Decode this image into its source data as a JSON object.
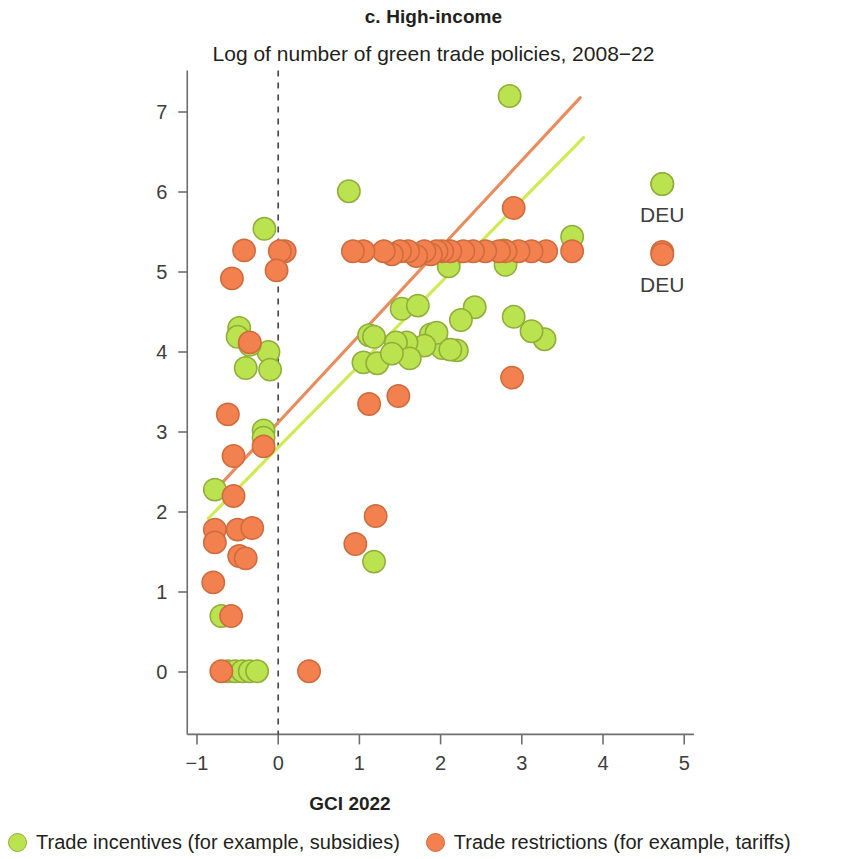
{
  "header": {
    "panel_label": "c. High-income",
    "subtitle": "Log of number of green trade policies, 2008−22"
  },
  "axes": {
    "x_title": "GCI 2022",
    "x_ticks": [
      "−1",
      "0",
      "1",
      "2",
      "3",
      "4",
      "5"
    ],
    "x_tick_values": [
      -1,
      0,
      1,
      2,
      3,
      4,
      5
    ],
    "y_ticks": [
      "0",
      "1",
      "2",
      "3",
      "4",
      "5",
      "6",
      "7"
    ],
    "y_tick_values": [
      0,
      1,
      2,
      3,
      4,
      5,
      6,
      7
    ]
  },
  "legend": {
    "items": [
      {
        "label": "Trade incentives (for example, subsidies)",
        "color": "#BBE34F",
        "swatch": "circle-green"
      },
      {
        "label": "Trade restrictions (for example, tariffs)",
        "color": "#F3804F",
        "swatch": "circle-orange"
      }
    ]
  },
  "annotations": [
    {
      "text": "DEU",
      "x": 4.73,
      "y": 5.73,
      "series": "Trade incentives (for example, subsidies)"
    },
    {
      "text": "DEU",
      "x": 4.73,
      "y": 4.85,
      "series": "Trade restrictions (for example, tariffs)"
    }
  ],
  "colors": {
    "incentives": "#BBE34F",
    "incentives_stroke": "#8FAE3A",
    "restrictions": "#F3804F",
    "restrictions_stroke": "#CF6B3C",
    "fit_incentives": "#CFEA52",
    "fit_restrictions": "#E98B5C",
    "axis": "#6e6e6e",
    "reference_line": "#4a4a4a",
    "text": "#231f20"
  },
  "chart_data": {
    "type": "scatter",
    "title": "c. High-income",
    "subtitle": "Log of number of green trade policies, 2008−22",
    "xlabel": "GCI 2022",
    "ylabel": "Log of number of green trade policies, 2008−22",
    "xlim": [
      -1.12,
      5.12
    ],
    "ylim": [
      -0.78,
      7.52
    ],
    "xticks": [
      -1,
      0,
      1,
      2,
      3,
      4,
      5
    ],
    "yticks": [
      0,
      1,
      2,
      3,
      4,
      5,
      6,
      7
    ],
    "grid": false,
    "legend_position": "below",
    "reference_lines": [
      {
        "orientation": "vertical",
        "value": 0,
        "style": "dashed",
        "color": "#4a4a4a"
      }
    ],
    "trend_lines": [
      {
        "name": "Trade restrictions (for example, tariffs)",
        "color": "#E98B5C",
        "x_start": -0.86,
        "y_start": 2.18,
        "x_end": 3.72,
        "y_end": 7.18
      },
      {
        "name": "Trade incentives (for example, subsidies)",
        "color": "#CFEA52",
        "x_start": -0.86,
        "y_start": 1.92,
        "x_end": 3.76,
        "y_end": 6.68
      }
    ],
    "series": [
      {
        "name": "Trade incentives (for example, subsidies)",
        "color": "#BBE34F",
        "marker": "circle",
        "points": [
          [
            2.85,
            7.2
          ],
          [
            0.87,
            6.01
          ],
          [
            4.73,
            6.1
          ],
          [
            -0.17,
            5.54
          ],
          [
            3.62,
            5.44
          ],
          [
            2.78,
            5.27
          ],
          [
            2.1,
            5.07
          ],
          [
            2.8,
            5.09
          ],
          [
            3.28,
            4.16
          ],
          [
            3.12,
            4.26
          ],
          [
            2.9,
            4.44
          ],
          [
            2.42,
            4.56
          ],
          [
            2.25,
            4.4
          ],
          [
            1.52,
            4.54
          ],
          [
            1.72,
            4.58
          ],
          [
            1.88,
            4.22
          ],
          [
            1.12,
            4.21
          ],
          [
            1.18,
            4.19
          ],
          [
            2.02,
            4.05
          ],
          [
            1.95,
            4.24
          ],
          [
            1.8,
            4.08
          ],
          [
            1.52,
            4.05
          ],
          [
            1.58,
            4.12
          ],
          [
            1.45,
            4.12
          ],
          [
            1.62,
            3.92
          ],
          [
            1.05,
            3.87
          ],
          [
            1.22,
            3.86
          ],
          [
            1.4,
            3.98
          ],
          [
            2.2,
            4.02
          ],
          [
            2.12,
            4.03
          ],
          [
            -0.12,
            4.0
          ],
          [
            -0.1,
            3.78
          ],
          [
            -0.48,
            4.3
          ],
          [
            -0.5,
            4.19
          ],
          [
            -0.35,
            4.09
          ],
          [
            -0.4,
            3.8
          ],
          [
            -0.18,
            3.02
          ],
          [
            -0.18,
            2.93
          ],
          [
            -0.78,
            2.28
          ],
          [
            -0.7,
            0.7
          ],
          [
            -0.62,
            0.01
          ],
          [
            -0.53,
            0.01
          ],
          [
            -0.44,
            0.01
          ],
          [
            -0.35,
            0.01
          ],
          [
            -0.26,
            0.01
          ],
          [
            1.18,
            1.38
          ]
        ]
      },
      {
        "name": "Trade restrictions (for example, tariffs)",
        "color": "#F3804F",
        "marker": "circle",
        "points": [
          [
            2.9,
            5.8
          ],
          [
            4.73,
            5.25
          ],
          [
            3.62,
            5.26
          ],
          [
            3.3,
            5.26
          ],
          [
            3.12,
            5.26
          ],
          [
            2.96,
            5.26
          ],
          [
            2.8,
            5.26
          ],
          [
            2.72,
            5.26
          ],
          [
            2.55,
            5.26
          ],
          [
            2.4,
            5.26
          ],
          [
            2.28,
            5.26
          ],
          [
            2.12,
            5.26
          ],
          [
            2.02,
            5.26
          ],
          [
            1.95,
            5.26
          ],
          [
            1.88,
            5.22
          ],
          [
            1.8,
            5.26
          ],
          [
            1.7,
            5.2
          ],
          [
            1.6,
            5.26
          ],
          [
            1.5,
            5.26
          ],
          [
            1.4,
            5.22
          ],
          [
            1.3,
            5.26
          ],
          [
            1.05,
            5.26
          ],
          [
            0.92,
            5.26
          ],
          [
            0.08,
            5.26
          ],
          [
            0.02,
            5.26
          ],
          [
            -0.42,
            5.27
          ],
          [
            -0.02,
            5.02
          ],
          [
            -0.57,
            4.92
          ],
          [
            2.88,
            3.68
          ],
          [
            1.48,
            3.45
          ],
          [
            1.12,
            3.35
          ],
          [
            -0.35,
            4.12
          ],
          [
            -0.62,
            3.22
          ],
          [
            -0.55,
            2.7
          ],
          [
            -0.18,
            2.82
          ],
          [
            -0.55,
            2.2
          ],
          [
            -0.78,
            1.78
          ],
          [
            -0.78,
            1.62
          ],
          [
            -0.5,
            1.78
          ],
          [
            -0.32,
            1.8
          ],
          [
            -0.48,
            1.45
          ],
          [
            -0.4,
            1.42
          ],
          [
            -0.8,
            1.12
          ],
          [
            -0.58,
            0.7
          ],
          [
            -0.7,
            0.01
          ],
          [
            0.38,
            0.01
          ],
          [
            1.2,
            1.95
          ],
          [
            0.95,
            1.6
          ]
        ]
      }
    ]
  }
}
